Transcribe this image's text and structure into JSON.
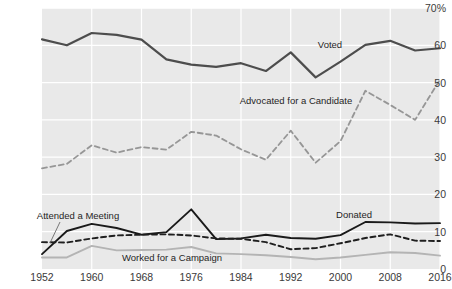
{
  "chart_data": {
    "type": "line",
    "title": "",
    "subtitle": "",
    "xlabel": "",
    "ylabel": "",
    "xlim": [
      1952,
      2016
    ],
    "ylim": [
      0,
      70
    ],
    "grid": true,
    "legend_position": "inline-annotations",
    "y_ticks": [
      0,
      10,
      20,
      30,
      40,
      50,
      60,
      70
    ],
    "y_tick_labels": [
      "0",
      "10",
      "20",
      "30",
      "40",
      "50",
      "60",
      "70%"
    ],
    "x_ticks": [
      1952,
      1960,
      1968,
      1976,
      1984,
      1992,
      2000,
      2008,
      2016
    ],
    "x_tick_labels": [
      "1952",
      "1960",
      "1968",
      "1976",
      "1984",
      "1992",
      "2000",
      "2008",
      "2016"
    ],
    "x": [
      1952,
      1956,
      1960,
      1964,
      1968,
      1972,
      1976,
      1980,
      1984,
      1988,
      1992,
      1996,
      2000,
      2004,
      2008,
      2012,
      2016
    ],
    "series": [
      {
        "name": "Voted",
        "style": "solid",
        "color": "#4d4d4d",
        "width": 2.2,
        "values": [
          61.6,
          60.0,
          63.3,
          62.8,
          61.5,
          56.2,
          54.8,
          54.2,
          55.2,
          53.1,
          58.1,
          51.4,
          55.6,
          60.1,
          61.2,
          58.6,
          59.2
        ]
      },
      {
        "name": "Advocated for a Candidate",
        "style": "dashed",
        "color": "#969696",
        "width": 1.8,
        "values": [
          27.0,
          28.2,
          33.2,
          31.2,
          32.7,
          32.0,
          36.8,
          35.8,
          32.1,
          29.3,
          37.1,
          28.5,
          34.3,
          47.8,
          44.0,
          40.0,
          50.8
        ]
      },
      {
        "name": "Attended a Meeting",
        "style": "solid",
        "color": "#1a1a1a",
        "width": 1.9,
        "values": [
          4.0,
          10.2,
          12.1,
          11.0,
          9.2,
          9.9,
          16.0,
          8.0,
          8.2,
          9.2,
          8.3,
          8.1,
          9.1,
          12.6,
          12.5,
          12.2,
          12.3
        ]
      },
      {
        "name": "Donated",
        "style": "dashed",
        "color": "#1f1f1f",
        "width": 1.9,
        "values": [
          7.2,
          7.1,
          8.2,
          9.0,
          9.2,
          9.3,
          9.0,
          8.2,
          8.1,
          7.2,
          5.3,
          5.6,
          6.9,
          8.3,
          9.3,
          7.6,
          7.5
        ]
      },
      {
        "name": "Worked for a Campaign",
        "style": "solid",
        "color": "#b4b4b4",
        "width": 1.9,
        "values": [
          3.1,
          3.1,
          6.2,
          5.0,
          5.1,
          5.2,
          5.9,
          4.2,
          4.0,
          3.7,
          3.2,
          2.6,
          3.1,
          3.8,
          4.5,
          4.3,
          3.6
        ]
      }
    ],
    "annotations": [
      {
        "text": "Voted",
        "x_px": 330,
        "y_px": 45
      },
      {
        "text": "Advocated for a Candidate",
        "x_px": 296,
        "y_px": 101
      },
      {
        "text": "Attended a Meeting",
        "x_px": 78,
        "y_px": 216
      },
      {
        "text": "Donated",
        "x_px": 354,
        "y_px": 215
      },
      {
        "text": "Worked for a Campaign",
        "x_px": 172,
        "y_px": 258
      }
    ],
    "leader_lines": [
      {
        "for": "Attended a Meeting",
        "x1": 60,
        "y1": 222,
        "x2": 50,
        "y2": 243
      }
    ],
    "colors": {
      "plot_background": "#e9e9e9",
      "page_background": "#ffffff",
      "gridline": "#ffffff",
      "tick_text": "#3a3a3a",
      "annotation_text": "#1f1f1f"
    }
  }
}
